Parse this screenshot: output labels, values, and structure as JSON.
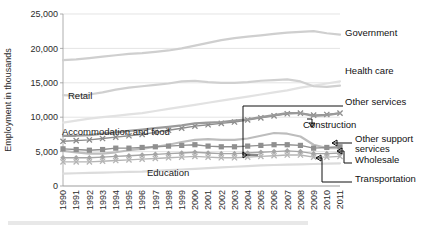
{
  "chart_data": {
    "type": "line",
    "title": "",
    "xlabel": "",
    "ylabel": "Employment in thousands",
    "ylim": [
      0,
      25000
    ],
    "yticks": [
      0,
      5000,
      10000,
      15000,
      20000,
      25000
    ],
    "ytick_labels": [
      "0",
      "5,000",
      "10,000",
      "15,000",
      "20,000",
      "25,000"
    ],
    "grid": true,
    "legend_position": "right-callouts",
    "categories": [
      1990,
      1991,
      1992,
      1993,
      1994,
      1995,
      1996,
      1997,
      1998,
      1999,
      2000,
      2001,
      2002,
      2003,
      2004,
      2005,
      2006,
      2007,
      2008,
      2009,
      2010,
      2011
    ],
    "xtick_labels": [
      "1990",
      "1991",
      "1992",
      "1993",
      "1994",
      "1995",
      "1996",
      "1997",
      "1998",
      "1999",
      "2000",
      "2001",
      "2002",
      "2003",
      "2004",
      "2005",
      "2006",
      "2007",
      "2008",
      "2009",
      "2010",
      "2011"
    ],
    "series": [
      {
        "name": "Government",
        "color": "#cfcfcf",
        "marker": "none",
        "values": [
          18300,
          18400,
          18600,
          18800,
          19000,
          19200,
          19300,
          19500,
          19700,
          20000,
          20400,
          20800,
          21200,
          21500,
          21700,
          21900,
          22100,
          22300,
          22400,
          22500,
          22200,
          22000
        ]
      },
      {
        "name": "Health care",
        "color": "#e2e2e2",
        "marker": "none",
        "values": [
          9200,
          9500,
          9800,
          10000,
          10200,
          10400,
          10600,
          10900,
          11200,
          11500,
          11800,
          12100,
          12400,
          12700,
          13000,
          13300,
          13600,
          13900,
          14300,
          14600,
          14900,
          15200
        ]
      },
      {
        "name": "Retail",
        "color": "#d0d0d0",
        "marker": "none",
        "values": [
          13200,
          13100,
          13300,
          13600,
          14000,
          14300,
          14500,
          14700,
          14900,
          15200,
          15300,
          15100,
          15000,
          15000,
          15100,
          15300,
          15400,
          15500,
          15200,
          14500,
          14400,
          14600
        ]
      },
      {
        "name": "Other services",
        "color": "#8c8c8c",
        "marker": "cross",
        "values": [
          6500,
          6600,
          6700,
          6900,
          7100,
          7300,
          7500,
          7800,
          8100,
          8400,
          8700,
          8900,
          9100,
          9300,
          9600,
          9900,
          10200,
          10500,
          10600,
          10300,
          10400,
          10600
        ]
      },
      {
        "name": "Accommodation and food",
        "color": "#9a9a9a",
        "marker": "none",
        "values": [
          7300,
          7300,
          7400,
          7600,
          7800,
          8000,
          8200,
          8400,
          8600,
          8800,
          9100,
          9200,
          9300,
          9500,
          9700,
          10000,
          10300,
          10600,
          10600,
          10200,
          10300,
          10600
        ]
      },
      {
        "name": "Construction",
        "color": "#bdbdbd",
        "marker": "none",
        "values": [
          5100,
          4900,
          4700,
          4700,
          4900,
          5200,
          5400,
          5700,
          6000,
          6400,
          6700,
          6800,
          6700,
          6700,
          6900,
          7300,
          7700,
          7600,
          7200,
          6000,
          5500,
          5500
        ]
      },
      {
        "name": "Other support services",
        "color": "#8f8f8f",
        "marker": "square",
        "values": [
          5400,
          5300,
          5200,
          5300,
          5500,
          5500,
          5600,
          5700,
          5800,
          5900,
          6000,
          5800,
          5700,
          5700,
          5800,
          5900,
          6000,
          6000,
          5900,
          5500,
          5600,
          5700
        ]
      },
      {
        "name": "Wholesale",
        "color": "#a5a5a5",
        "marker": "diamond",
        "values": [
          4100,
          4100,
          4100,
          4200,
          4300,
          4400,
          4500,
          4600,
          4700,
          4800,
          4900,
          4800,
          4700,
          4700,
          4800,
          4900,
          5000,
          5100,
          5000,
          4700,
          4700,
          4800
        ]
      },
      {
        "name": "Transportation",
        "color": "#b5b5b5",
        "marker": "cross",
        "values": [
          3500,
          3500,
          3500,
          3600,
          3700,
          3800,
          3900,
          4000,
          4100,
          4200,
          4300,
          4200,
          4100,
          4100,
          4200,
          4300,
          4400,
          4500,
          4500,
          4200,
          4200,
          4300
        ]
      },
      {
        "name": "Education",
        "color": "#dcdcdc",
        "marker": "none",
        "values": [
          1800,
          1850,
          1900,
          1950,
          2000,
          2050,
          2100,
          2200,
          2300,
          2400,
          2500,
          2600,
          2700,
          2800,
          2900,
          3000,
          3050,
          3100,
          3150,
          3200,
          3250,
          3300
        ]
      }
    ],
    "inline_labels": [
      {
        "text": "Retail",
        "x": 68,
        "y": 99
      },
      {
        "text": "Accommodation and food",
        "x": 62,
        "y": 135
      },
      {
        "text": "Education",
        "x": 147,
        "y": 176
      }
    ],
    "callouts": [
      {
        "text": "Government",
        "x": 345,
        "y": 36
      },
      {
        "text": "Health care",
        "x": 345,
        "y": 74
      },
      {
        "text": "Other services",
        "x": 345,
        "y": 105
      },
      {
        "text": "Construction",
        "x": 303,
        "y": 128
      },
      {
        "text": "Other support",
        "x": 355,
        "y": 142
      },
      {
        "text": "services",
        "x": 355,
        "y": 152
      },
      {
        "text": "Wholesale",
        "x": 355,
        "y": 163
      },
      {
        "text": "Transportation",
        "x": 355,
        "y": 182
      }
    ],
    "axis_label_text": "Employment in thousands"
  }
}
